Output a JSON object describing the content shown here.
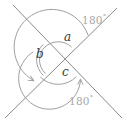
{
  "figure": {
    "type": "geometry-diagram",
    "colors": {
      "line": "#8a8a8a",
      "arc": "#9a9a9a",
      "letter": "#3a3a3a",
      "degree_label": "#a8a8a8",
      "background": "#ffffff"
    },
    "intersection": {
      "x": 58,
      "y": 60
    },
    "lines": [
      {
        "name": "line-ne-sw",
        "x1": 13,
        "y1": 5,
        "x2": 122,
        "y2": 118
      },
      {
        "name": "line-nw-se",
        "x1": 117,
        "y1": 8,
        "x2": 5,
        "y2": 118
      }
    ],
    "angle_labels": [
      {
        "id": "a",
        "text": "a",
        "x": 64,
        "y": 37
      },
      {
        "id": "b",
        "text": "b",
        "x": 36,
        "y": 54
      },
      {
        "id": "c",
        "text": "c",
        "x": 62,
        "y": 72
      }
    ],
    "degree_labels": [
      {
        "id": "top-right",
        "value": "180",
        "symbol": "°",
        "x": 82,
        "y": 14
      },
      {
        "id": "bottom-right",
        "value": "180",
        "symbol": "°",
        "x": 69,
        "y": 95
      }
    ],
    "arcs": [
      {
        "id": "arc-a",
        "label": "a",
        "radius": 19
      },
      {
        "id": "arc-b-inner",
        "label": "b",
        "radius": 18
      },
      {
        "id": "arc-b-outer",
        "label": "b",
        "radius": 21
      },
      {
        "id": "arc-c",
        "label": "c",
        "radius": 25
      },
      {
        "id": "arc-180-top",
        "label": "180",
        "radius": 38
      },
      {
        "id": "arc-180-bottom",
        "label": "180",
        "radius": 31
      }
    ],
    "arrowheads": [
      {
        "id": "arrow-lower-left",
        "x": 32,
        "y": 82,
        "direction": "down-left"
      },
      {
        "id": "arrow-lower-right",
        "x": 82,
        "y": 78,
        "direction": "up-right"
      }
    ]
  }
}
